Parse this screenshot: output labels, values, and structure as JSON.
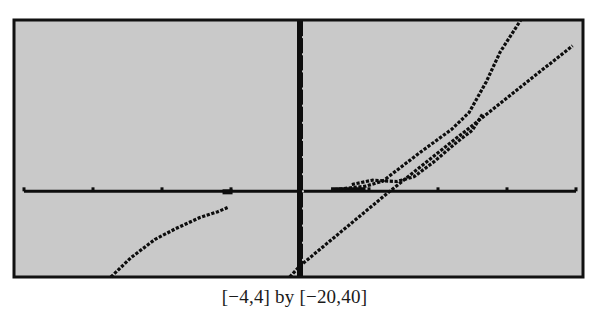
{
  "chart_data": {
    "type": "line",
    "title": "",
    "caption": "[−4,4] by [−20,40]",
    "xlabel": "",
    "ylabel": "",
    "xlim": [
      -4,
      4
    ],
    "ylim": [
      -20,
      40
    ],
    "grid": false,
    "legend": "none",
    "x_ticks_scale": 1,
    "y_ticks_scale": 1,
    "series": [
      {
        "name": "curve-left",
        "description": "increasing concave-down curve rising from bottom to meet x-axis near x=-1",
        "points": [
          [
            -2.74,
            -20
          ],
          [
            -2.45,
            -15.5
          ],
          [
            -2.1,
            -11.2
          ],
          [
            -1.8,
            -8.7
          ],
          [
            -1.45,
            -6.1
          ],
          [
            -1.2,
            -4.8
          ],
          [
            -1.05,
            -3.8
          ]
        ]
      },
      {
        "name": "line",
        "description": "straight increasing line",
        "points": [
          [
            -0.15,
            -20
          ],
          [
            0.0,
            -17.4
          ],
          [
            1.3,
            0
          ],
          [
            3.95,
            34
          ]
        ]
      },
      {
        "name": "curve-right-steep",
        "description": "steep increasing curve forming a small loop with a parallel branch",
        "points": [
          [
            0.5,
            0.4
          ],
          [
            0.95,
            1.2
          ],
          [
            1.2,
            2.4
          ],
          [
            1.75,
            9.2
          ],
          [
            2.2,
            14.5
          ],
          [
            2.45,
            18.4
          ],
          [
            2.7,
            25.6
          ],
          [
            2.9,
            32.5
          ],
          [
            3.2,
            40
          ]
        ]
      },
      {
        "name": "curve-right-branch",
        "description": "branch near x-axis joining the steep curve",
        "points": [
          [
            0.75,
            1.6
          ],
          [
            1.05,
            2.6
          ],
          [
            1.4,
            2.3
          ],
          [
            1.65,
            3.4
          ],
          [
            1.95,
            7.0
          ],
          [
            2.25,
            11.2
          ],
          [
            2.5,
            14.3
          ],
          [
            2.65,
            18.2
          ]
        ]
      }
    ]
  },
  "screen": {
    "bg": "#c9c9c9",
    "frame_color": "#111111",
    "ink": "#0d0d0d"
  }
}
